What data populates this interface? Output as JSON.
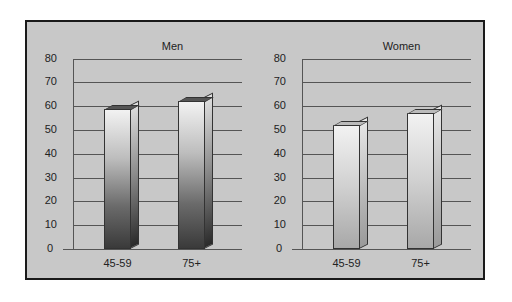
{
  "chart_data": [
    {
      "type": "bar",
      "title": "Men",
      "categories": [
        "45-59",
        "75+"
      ],
      "values": [
        59,
        62
      ],
      "xlabel": "",
      "ylabel": "",
      "ylim": [
        0,
        80
      ],
      "yticks": [
        0,
        10,
        20,
        30,
        40,
        50,
        60,
        70,
        80
      ],
      "grid": true,
      "style": "3d-bar-gradient-dark"
    },
    {
      "type": "bar",
      "title": "Women",
      "categories": [
        "45-59",
        "75+"
      ],
      "values": [
        52,
        57
      ],
      "xlabel": "",
      "ylabel": "",
      "ylim": [
        0,
        80
      ],
      "yticks": [
        0,
        10,
        20,
        30,
        40,
        50,
        60,
        70,
        80
      ],
      "grid": true,
      "style": "3d-bar-gradient-light"
    }
  ],
  "colors": {
    "background": "#c8c8c8",
    "frame": "#1a1a1a",
    "gridline": "#555555",
    "men_bar_top": "#f2f2f2",
    "men_bar_bottom": "#3a3a3a",
    "women_bar_top": "#f2f2f2",
    "women_bar_bottom": "#a8a8a8"
  }
}
